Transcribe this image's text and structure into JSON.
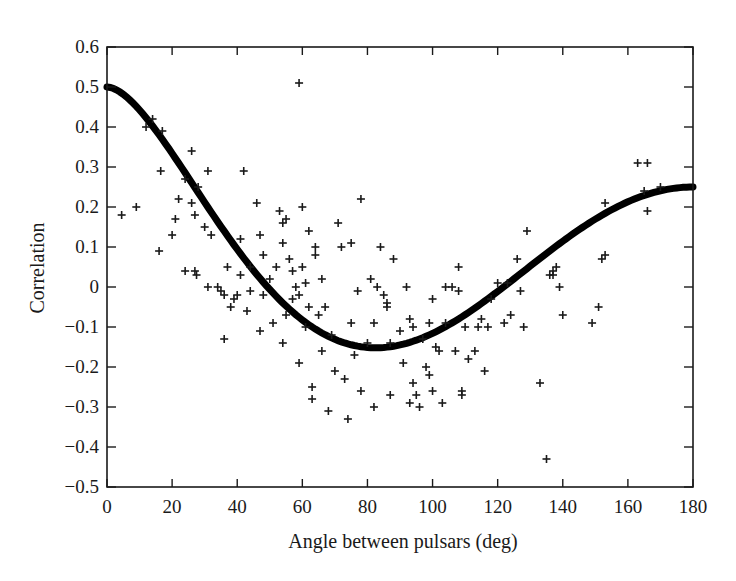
{
  "chart_data": {
    "type": "scatter",
    "title": "",
    "xlabel": "Angle between pulsars (deg)",
    "ylabel": "Correlation",
    "xlim": [
      0,
      180
    ],
    "ylim": [
      -0.5,
      0.6
    ],
    "xticks": [
      0,
      20,
      40,
      60,
      80,
      100,
      120,
      140,
      160,
      180
    ],
    "yticks": [
      0.6,
      0.5,
      0.4,
      0.3,
      0.2,
      0.1,
      0,
      -0.1,
      -0.2,
      -0.3,
      -0.4,
      -0.5
    ],
    "ytick_labels": [
      "0.6",
      "0.5",
      "0.4",
      "0.3",
      "0.2",
      "0.1",
      "0",
      "−0.1",
      "−0.2",
      "−0.3",
      "−0.4",
      "−0.5"
    ],
    "xtick_labels": [
      "0",
      "20",
      "40",
      "60",
      "80",
      "100",
      "120",
      "140",
      "160",
      "180"
    ],
    "grid": false,
    "legend": null,
    "series": [
      {
        "name": "Measured pulsar-pair correlations",
        "type": "scatter",
        "marker": "+",
        "color": "#1a1a1a",
        "points": [
          [
            4.5,
            0.18
          ],
          [
            9,
            0.2
          ],
          [
            12,
            0.4
          ],
          [
            14,
            0.42
          ],
          [
            16,
            0.09
          ],
          [
            16.5,
            0.29
          ],
          [
            17,
            0.39
          ],
          [
            20,
            0.13
          ],
          [
            21,
            0.17
          ],
          [
            22,
            0.22
          ],
          [
            24,
            0.27
          ],
          [
            24,
            0.04
          ],
          [
            26,
            0.34
          ],
          [
            26,
            0.21
          ],
          [
            27,
            0.18
          ],
          [
            27,
            0.04
          ],
          [
            27.5,
            0.03
          ],
          [
            28,
            0.25
          ],
          [
            30,
            0.15
          ],
          [
            31,
            0.29
          ],
          [
            31,
            0.0
          ],
          [
            32,
            0.13
          ],
          [
            34,
            0.0
          ],
          [
            35,
            -0.01
          ],
          [
            36,
            -0.02
          ],
          [
            36,
            -0.13
          ],
          [
            37,
            0.05
          ],
          [
            38,
            -0.05
          ],
          [
            39,
            -0.03
          ],
          [
            40,
            -0.02
          ],
          [
            41,
            0.12
          ],
          [
            41,
            0.03
          ],
          [
            42,
            0.29
          ],
          [
            43,
            -0.06
          ],
          [
            44,
            0.05
          ],
          [
            44,
            -0.01
          ],
          [
            46,
            0.21
          ],
          [
            47,
            0.13
          ],
          [
            47,
            -0.11
          ],
          [
            48,
            0.08
          ],
          [
            48,
            -0.02
          ],
          [
            50,
            0.02
          ],
          [
            51,
            -0.09
          ],
          [
            52,
            0.05
          ],
          [
            53,
            0.19
          ],
          [
            54,
            0.16
          ],
          [
            54,
            0.11
          ],
          [
            54,
            -0.14
          ],
          [
            55,
            0.17
          ],
          [
            55,
            -0.07
          ],
          [
            56,
            0.07
          ],
          [
            57,
            0.04
          ],
          [
            57,
            -0.03
          ],
          [
            58,
            0.0
          ],
          [
            59,
            -0.02
          ],
          [
            59,
            -0.19
          ],
          [
            59,
            0.51
          ],
          [
            60,
            0.05
          ],
          [
            60,
            0.2
          ],
          [
            61,
            -0.1
          ],
          [
            61,
            0.01
          ],
          [
            62,
            0.14
          ],
          [
            62,
            -0.05
          ],
          [
            63,
            -0.28
          ],
          [
            63,
            -0.25
          ],
          [
            64,
            0.08
          ],
          [
            64,
            0.1
          ],
          [
            65,
            -0.07
          ],
          [
            66,
            -0.16
          ],
          [
            66,
            0.02
          ],
          [
            67,
            -0.05
          ],
          [
            68,
            -0.31
          ],
          [
            69,
            -0.12
          ],
          [
            70,
            -0.21
          ],
          [
            71,
            0.16
          ],
          [
            72,
            0.1
          ],
          [
            73,
            -0.23
          ],
          [
            74,
            -0.33
          ],
          [
            75,
            0.11
          ],
          [
            75,
            -0.09
          ],
          [
            76,
            -0.17
          ],
          [
            77,
            -0.01
          ],
          [
            78,
            -0.26
          ],
          [
            78,
            0.22
          ],
          [
            80,
            -0.14
          ],
          [
            81,
            0.02
          ],
          [
            82,
            -0.09
          ],
          [
            82,
            -0.3
          ],
          [
            83,
            0.0
          ],
          [
            84,
            0.1
          ],
          [
            85,
            -0.02
          ],
          [
            86,
            -0.05
          ],
          [
            86,
            -0.04
          ],
          [
            87,
            -0.27
          ],
          [
            87,
            -0.14
          ],
          [
            88,
            0.07
          ],
          [
            90,
            -0.11
          ],
          [
            91,
            -0.19
          ],
          [
            92,
            0.0
          ],
          [
            93,
            -0.29
          ],
          [
            93,
            -0.08
          ],
          [
            94,
            -0.1
          ],
          [
            94,
            -0.24
          ],
          [
            95,
            -0.27
          ],
          [
            96,
            -0.3
          ],
          [
            97,
            -0.13
          ],
          [
            98,
            -0.2
          ],
          [
            99,
            -0.22
          ],
          [
            99,
            -0.09
          ],
          [
            100,
            -0.03
          ],
          [
            100,
            -0.26
          ],
          [
            101,
            -0.15
          ],
          [
            102,
            -0.16
          ],
          [
            103,
            -0.29
          ],
          [
            104,
            0.0
          ],
          [
            104,
            -0.09
          ],
          [
            106,
            0.0
          ],
          [
            107,
            -0.16
          ],
          [
            108,
            -0.01
          ],
          [
            108,
            0.05
          ],
          [
            109,
            -0.27
          ],
          [
            109,
            -0.26
          ],
          [
            110,
            -0.1
          ],
          [
            111,
            -0.18
          ],
          [
            113,
            -0.16
          ],
          [
            114,
            -0.1
          ],
          [
            115,
            -0.08
          ],
          [
            116,
            -0.21
          ],
          [
            117,
            -0.1
          ],
          [
            118,
            -0.03
          ],
          [
            120,
            0.01
          ],
          [
            122,
            -0.09
          ],
          [
            123,
            0.01
          ],
          [
            124,
            -0.07
          ],
          [
            126,
            0.07
          ],
          [
            127,
            -0.01
          ],
          [
            128,
            -0.1
          ],
          [
            129,
            0.14
          ],
          [
            133,
            -0.24
          ],
          [
            135,
            -0.43
          ],
          [
            136,
            0.03
          ],
          [
            137,
            0.04
          ],
          [
            137,
            0.03
          ],
          [
            138,
            0.05
          ],
          [
            139,
            0.0
          ],
          [
            140,
            -0.07
          ],
          [
            149,
            -0.09
          ],
          [
            151,
            -0.05
          ],
          [
            152,
            0.07
          ],
          [
            153,
            0.08
          ],
          [
            153,
            0.21
          ],
          [
            163,
            0.31
          ],
          [
            165,
            0.24
          ],
          [
            166,
            0.31
          ],
          [
            166,
            0.19
          ],
          [
            170,
            0.25
          ]
        ]
      },
      {
        "name": "Hellings-Downs curve",
        "type": "line",
        "color": "#000000",
        "line_width": 7,
        "formula": "x=(1-cos(theta))/2; C = 1.5*x*ln(x) - 0.25*x + 0.5",
        "key_values": [
          [
            0,
            0.5
          ],
          [
            20,
            0.35
          ],
          [
            40,
            0.08
          ],
          [
            60,
            -0.09
          ],
          [
            82,
            -0.15
          ],
          [
            100,
            -0.11
          ],
          [
            120,
            -0.02
          ],
          [
            140,
            0.1
          ],
          [
            160,
            0.2
          ],
          [
            180,
            0.25
          ]
        ]
      }
    ]
  },
  "layout": {
    "plot_left": 107,
    "plot_right": 693,
    "plot_top": 47,
    "plot_bottom": 487
  }
}
